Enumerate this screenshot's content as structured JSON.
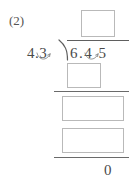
{
  "worksheet": {
    "problem_label": "(2)",
    "problem_type": "long-division-with-decimals",
    "divisor": "4.3",
    "dividend": "6.4 5",
    "final_remainder": "0",
    "quotient_box_value": "",
    "partial_product_box_1_value": "",
    "partial_remainder_box_value": "",
    "partial_product_box_2_value": "",
    "colors": {
      "ink": "#4a4a4a",
      "rule": "#6a6a6a",
      "box_border": "#b9b9b9",
      "paper": "#ffffff"
    },
    "icons": {
      "division_bracket": "division-bracket-icon",
      "decimal_shift_arc": "decimal-shift-arc-icon"
    }
  }
}
